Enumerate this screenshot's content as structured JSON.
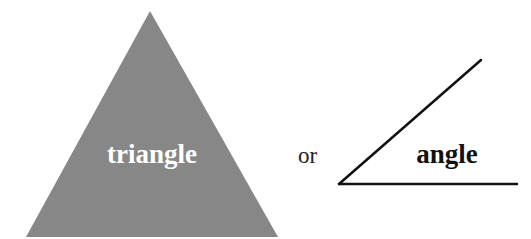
{
  "diagram": {
    "triangle": {
      "label": "triangle",
      "fill": "#878787",
      "label_color": "#ffffff",
      "points": [
        [
          150,
          11
        ],
        [
          26,
          237
        ],
        [
          278,
          237
        ]
      ]
    },
    "connector": {
      "label": "or"
    },
    "angle": {
      "label": "angle",
      "stroke": "#111111",
      "vertex": [
        339,
        184
      ],
      "arm_end": [
        481,
        60
      ],
      "base_end": [
        517,
        184
      ]
    }
  }
}
